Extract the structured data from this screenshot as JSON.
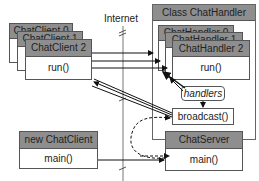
{
  "internet_label": "Internet",
  "clients": [
    {
      "title": "ChatClient 0"
    },
    {
      "title": "ChatClient 1"
    },
    {
      "title": "ChatClient 2",
      "method": "run()"
    }
  ],
  "handler_class": {
    "title": "Class ChatHandler",
    "handlers": [
      {
        "title": "ChatHandler 0"
      },
      {
        "title": "ChatHandler 1"
      },
      {
        "title": "ChatHandler 2",
        "method": "run()"
      }
    ],
    "handlers_field": "handlers",
    "broadcast_method": "broadcast()"
  },
  "new_client": {
    "title": "new ChatClient",
    "method": "main()"
  },
  "server": {
    "title": "ChatServer",
    "method": "main()"
  }
}
